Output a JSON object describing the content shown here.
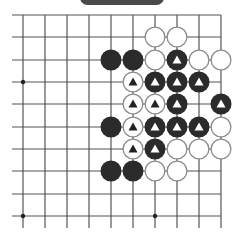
{
  "banner": {
    "label": "",
    "color": "#4a4a4a"
  },
  "board": {
    "line_color": "#555555",
    "cols_x": [
      23,
      45,
      67,
      89,
      111,
      133,
      155,
      177,
      199,
      221
    ],
    "rows_y": [
      15,
      37,
      60,
      82,
      104,
      127,
      149,
      171,
      194,
      216
    ],
    "left_stub_x": 12,
    "bottom_stub_y": 228,
    "right_edge": true,
    "top_edge": true,
    "star_points": [
      [
        0,
        3
      ],
      [
        0,
        9
      ],
      [
        6,
        9
      ],
      [
        6,
        3
      ]
    ],
    "stone_radius": 10.5,
    "stones": [
      {
        "c": 6,
        "r": 1,
        "color": "white",
        "mark": false
      },
      {
        "c": 7,
        "r": 1,
        "color": "white",
        "mark": false
      },
      {
        "c": 4,
        "r": 2,
        "color": "black",
        "mark": false
      },
      {
        "c": 5,
        "r": 2,
        "color": "black",
        "mark": false
      },
      {
        "c": 6,
        "r": 2,
        "color": "white",
        "mark": false
      },
      {
        "c": 7,
        "r": 2,
        "color": "black",
        "mark": true
      },
      {
        "c": 8,
        "r": 2,
        "color": "white",
        "mark": false
      },
      {
        "c": 9,
        "r": 2,
        "color": "white",
        "mark": false
      },
      {
        "c": 5,
        "r": 3,
        "color": "white",
        "mark": true
      },
      {
        "c": 6,
        "r": 3,
        "color": "black",
        "mark": true
      },
      {
        "c": 7,
        "r": 3,
        "color": "black",
        "mark": true
      },
      {
        "c": 8,
        "r": 3,
        "color": "black",
        "mark": true
      },
      {
        "c": 5,
        "r": 4,
        "color": "white",
        "mark": true
      },
      {
        "c": 6,
        "r": 4,
        "color": "white",
        "mark": true
      },
      {
        "c": 7,
        "r": 4,
        "color": "black",
        "mark": true
      },
      {
        "c": 9,
        "r": 4,
        "color": "black",
        "mark": true
      },
      {
        "c": 4,
        "r": 5,
        "color": "black",
        "mark": false
      },
      {
        "c": 5,
        "r": 5,
        "color": "white",
        "mark": true
      },
      {
        "c": 6,
        "r": 5,
        "color": "black",
        "mark": true
      },
      {
        "c": 7,
        "r": 5,
        "color": "black",
        "mark": true
      },
      {
        "c": 8,
        "r": 5,
        "color": "black",
        "mark": true
      },
      {
        "c": 9,
        "r": 5,
        "color": "white",
        "mark": false
      },
      {
        "c": 5,
        "r": 6,
        "color": "white",
        "mark": true
      },
      {
        "c": 6,
        "r": 6,
        "color": "black",
        "mark": true
      },
      {
        "c": 7,
        "r": 6,
        "color": "white",
        "mark": false
      },
      {
        "c": 8,
        "r": 6,
        "color": "white",
        "mark": false
      },
      {
        "c": 9,
        "r": 6,
        "color": "white",
        "mark": false
      },
      {
        "c": 4,
        "r": 7,
        "color": "black",
        "mark": false
      },
      {
        "c": 5,
        "r": 7,
        "color": "black",
        "mark": false
      },
      {
        "c": 6,
        "r": 7,
        "color": "white",
        "mark": false
      },
      {
        "c": 7,
        "r": 7,
        "color": "white",
        "mark": false
      }
    ],
    "colors": {
      "black_stone": "#2b2b2b",
      "white_stone": "#ffffff",
      "white_stroke": "#8a8a8a",
      "mark_on_black": "#ffffff",
      "mark_on_white": "#222222"
    }
  }
}
